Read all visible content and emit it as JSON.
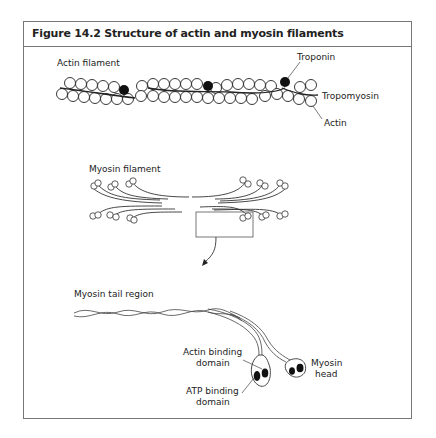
{
  "figure": {
    "title": "Figure 14.2 Structure of actin and myosin filaments"
  },
  "actin_panel": {
    "label": "Actin filament",
    "callouts": {
      "troponin": "Troponin",
      "tropomyosin": "Tropomyosin",
      "actin": "Actin"
    }
  },
  "myosin_filament_panel": {
    "label": "Myosin filament"
  },
  "myosin_tail_panel": {
    "label": "Myosin tail region",
    "callouts": {
      "actin_binding_line1": "Actin binding",
      "actin_binding_line2": "domain",
      "atp_binding_line1": "ATP binding",
      "atp_binding_line2": "domain",
      "myosin_head_line1": "Myosin",
      "myosin_head_line2": "head"
    }
  },
  "colors": {
    "frame": "#777777",
    "ink": "#222222",
    "background": "#ffffff"
  }
}
